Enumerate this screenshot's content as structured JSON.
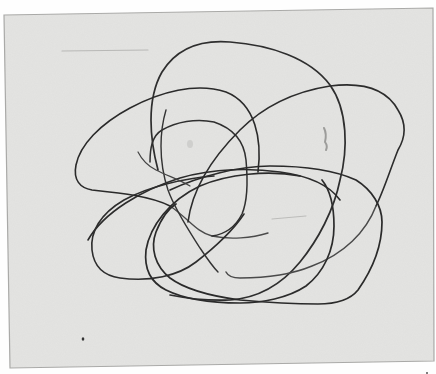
{
  "image": {
    "description": "Scanned sheet of paper with a continuous pencil scribble of overlapping loops",
    "caption": "Scribble drawing of tangled looping lines on gray paper"
  },
  "colors": {
    "background": "#fefefe",
    "paper": "#e4e4e2",
    "paper_edge": "#a9a9a7",
    "stroke_dark": "#2a2a2a",
    "stroke_mid": "#4a4a4a",
    "stroke_light": "#6d6d6d",
    "faint_mark": "#b8b8b6"
  },
  "paper": {
    "corners": [
      [
        4,
        15
      ],
      [
        433,
        8
      ],
      [
        434,
        361
      ],
      [
        10,
        368
      ]
    ]
  }
}
